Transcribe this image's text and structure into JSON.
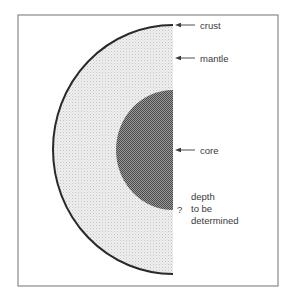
{
  "diagram": {
    "type": "earth-cross-section",
    "frame": {
      "x": 18,
      "y": 15,
      "width": 260,
      "height": 271,
      "stroke": "#8a8a8a"
    },
    "crust": {
      "cx": 173,
      "cy": 149.5,
      "rx": 120,
      "ry": 124.5,
      "stroke": "#2a2a2a",
      "stroke_width": 2
    },
    "mantle": {
      "fill": "#ebebeb",
      "dot": "#c8c8c8"
    },
    "core": {
      "cx": 173,
      "cy": 150,
      "rx": 57,
      "ry": 60,
      "fill": "#7a7a7a",
      "dot_dark": "#555555",
      "dot_light": "#bdbdbd"
    },
    "labels": {
      "crust": "crust",
      "mantle": "mantle",
      "core": "core",
      "question": "?",
      "depth_line1": "depth",
      "depth_line2": "to be",
      "depth_line3": "determined"
    },
    "arrows": [
      {
        "name": "crust",
        "y": 25,
        "x1": 195,
        "x2": 175
      },
      {
        "name": "mantle",
        "y": 58,
        "x1": 195,
        "x2": 175
      },
      {
        "name": "core",
        "y": 150,
        "x1": 195,
        "x2": 175
      }
    ]
  }
}
